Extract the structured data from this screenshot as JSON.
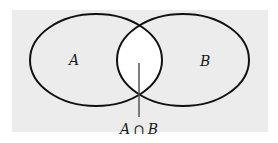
{
  "diagram": {
    "type": "venn",
    "background_color": "#ececec",
    "intersection_color": "#ffffff",
    "stroke_color": "#111111",
    "sets": [
      {
        "id": "A",
        "label": "A"
      },
      {
        "id": "B",
        "label": "B"
      }
    ],
    "intersection": {
      "label_left": "A",
      "operator": "∩",
      "label_right": "B"
    }
  }
}
